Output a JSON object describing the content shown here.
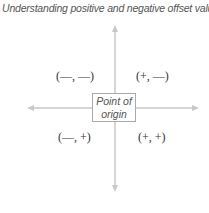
{
  "title": "Understanding positive and negative offset values",
  "origin_label_line1": "Point of",
  "origin_label_line2": "origin",
  "quadrants": {
    "top_left": "(—, —)",
    "top_right": "(+, —)",
    "bottom_left": "(—, +)",
    "bottom_right": "(+, +)"
  },
  "colors": {
    "axis": "#c8c8c8",
    "text": "#333333"
  }
}
